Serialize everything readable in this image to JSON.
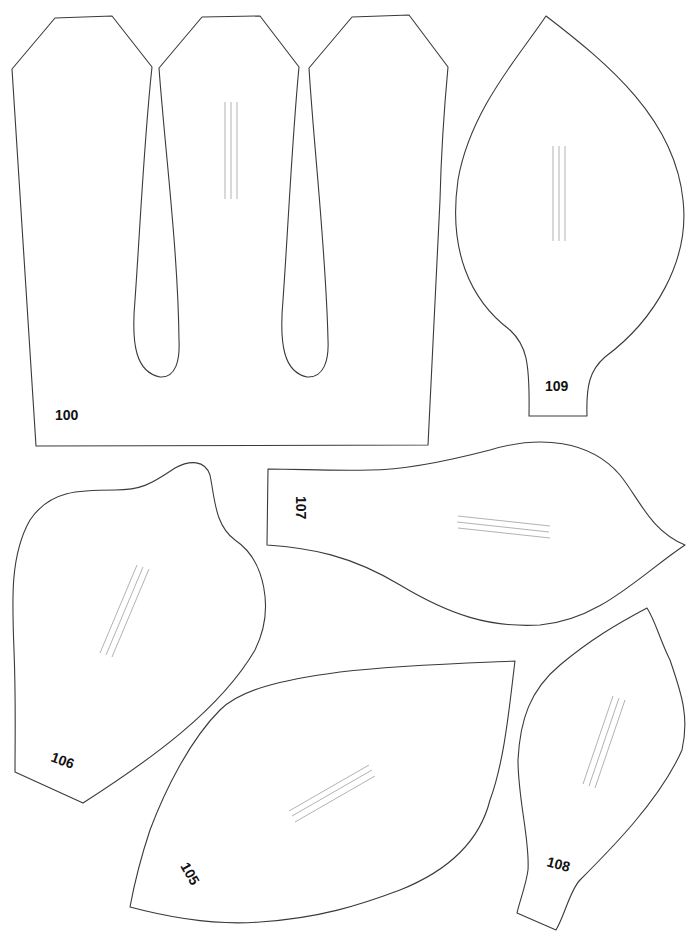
{
  "template": {
    "title": "Paper flower petal templates",
    "outline_color": "#3a3a3a",
    "vein_color": "#a9a9a9",
    "label_color": "#111111",
    "pieces": [
      {
        "id": "100",
        "label": "100",
        "shape": "three-petal crown strip",
        "orientation_deg": 0
      },
      {
        "id": "109",
        "label": "109",
        "shape": "pointed petal with stem tab",
        "orientation_deg": 0
      },
      {
        "id": "106",
        "label": "106",
        "shape": "irregular cupped petal",
        "orientation_deg": 20
      },
      {
        "id": "107",
        "label": "107",
        "shape": "elongated petal, tab on left",
        "orientation_deg": 90
      },
      {
        "id": "105",
        "label": "105",
        "shape": "broad diamond petal",
        "orientation_deg": 60
      },
      {
        "id": "108",
        "label": "108",
        "shape": "narrow curved petal with tab",
        "orientation_deg": 15
      }
    ]
  }
}
